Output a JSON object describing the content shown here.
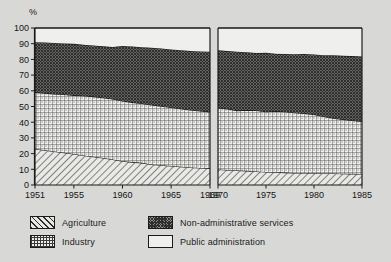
{
  "chart_data": {
    "type": "area",
    "title": "",
    "subtitle": "",
    "xlabel": "",
    "ylabel": "%",
    "ylim": [
      0,
      100
    ],
    "stacked": true,
    "stacked_to_100": true,
    "grid": false,
    "legend_position": "bottom-left",
    "yticks": [
      0,
      10,
      20,
      30,
      40,
      50,
      60,
      70,
      80,
      90,
      100
    ],
    "panels": [
      {
        "name": "panel-left",
        "x": [
          1951,
          1952,
          1953,
          1954,
          1955,
          1956,
          1957,
          1958,
          1959,
          1960,
          1961,
          1962,
          1963,
          1964,
          1965,
          1966,
          1967,
          1968,
          1969
        ],
        "xticks": [
          1951,
          1955,
          1960,
          1965,
          1969
        ],
        "xlim": [
          1951,
          1969
        ],
        "series": [
          {
            "name": "Agriculture",
            "values": [
              23.0,
              22.2,
              21.4,
              20.6,
              19.7,
              18.8,
              18.0,
              17.2,
              16.3,
              15.2,
              14.6,
              14.1,
              13.1,
              12.6,
              12.1,
              11.6,
              11.2,
              10.9,
              10.6
            ]
          },
          {
            "name": "Industry",
            "values": [
              36.0,
              36.3,
              36.6,
              37.0,
              37.4,
              38.0,
              38.3,
              38.4,
              38.5,
              38.3,
              38.0,
              37.8,
              37.9,
              37.6,
              37.3,
              37.0,
              36.6,
              36.2,
              36.0
            ]
          },
          {
            "name": "Non-administrative services",
            "values": [
              32.0,
              32.3,
              32.5,
              32.6,
              32.8,
              32.5,
              32.6,
              32.7,
              33.1,
              35.1,
              35.6,
              35.9,
              36.4,
              36.7,
              36.9,
              37.3,
              37.6,
              38.0,
              38.3
            ]
          },
          {
            "name": "Public administration",
            "values": [
              9.0,
              9.2,
              9.5,
              9.8,
              10.1,
              10.7,
              11.1,
              11.7,
              12.1,
              11.4,
              11.8,
              12.2,
              12.6,
              13.1,
              13.7,
              14.1,
              14.6,
              14.9,
              15.1
            ]
          }
        ]
      },
      {
        "name": "panel-right",
        "x": [
          1970,
          1971,
          1972,
          1973,
          1974,
          1975,
          1976,
          1977,
          1978,
          1979,
          1980,
          1981,
          1982,
          1983,
          1984,
          1985
        ],
        "xticks": [
          1970,
          1975,
          1980,
          1985
        ],
        "xlim": [
          1970,
          1985
        ],
        "series": [
          {
            "name": "Agriculture",
            "values": [
              9.9,
              9.6,
              9.3,
              9.0,
              8.6,
              8.3,
              8.1,
              7.9,
              7.7,
              7.6,
              7.5,
              7.4,
              7.3,
              7.2,
              7.1,
              7.0
            ]
          },
          {
            "name": "Industry",
            "values": [
              39.1,
              38.9,
              38.1,
              38.7,
              38.9,
              38.4,
              38.9,
              38.8,
              38.3,
              38.0,
              37.4,
              36.2,
              35.2,
              34.6,
              34.0,
              33.5
            ]
          },
          {
            "name": "Non-administrative services",
            "values": [
              36.9,
              36.8,
              37.5,
              36.9,
              36.6,
              37.5,
              36.6,
              36.7,
              37.3,
              37.8,
              38.2,
              39.1,
              40.1,
              40.6,
              41.0,
              41.3
            ]
          },
          {
            "name": "Public administration",
            "values": [
              14.1,
              14.7,
              15.1,
              15.4,
              15.9,
              15.8,
              16.4,
              16.6,
              16.7,
              16.6,
              16.9,
              17.3,
              17.4,
              17.6,
              17.9,
              18.2
            ]
          }
        ]
      }
    ],
    "legend": [
      {
        "key": "agriculture",
        "label": "Agriculture",
        "pattern": "diagonal-hatch"
      },
      {
        "key": "industry",
        "label": "Industry",
        "pattern": "cross-dotted"
      },
      {
        "key": "non-administrative-services",
        "label": "Non-administrative services",
        "pattern": "dark-crosshatch"
      },
      {
        "key": "public-administration",
        "label": "Public administration",
        "pattern": "solid-white"
      }
    ],
    "colors": {
      "agriculture": "#e7e7e4",
      "industry": "#eeeeec",
      "non_administrative_services": "#8e8e8c",
      "public_administration": "#efefed",
      "axis": "#1b1b1b",
      "background": "#d8d8d6"
    }
  }
}
